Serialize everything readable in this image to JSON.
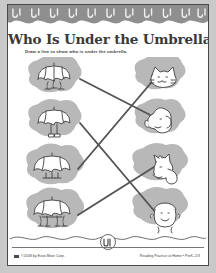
{
  "page": {
    "title": "Who Is Under the Umbrella?",
    "instruction": "Draw a line to show who is under the umbrella.",
    "background_color": "#ffffff",
    "border_color": "#4a4a4a",
    "header_band_color": "#8f8f8f",
    "blob_color": "#b4b4b4",
    "line_color": "#5a5a5a",
    "ink_color": "#3a3a3a"
  },
  "activity": {
    "type": "matching-worksheet",
    "row_count": 4,
    "left_column": [
      {
        "id": "umbrella-paws-small",
        "label": "umbrella with small paws",
        "creature": "cat"
      },
      {
        "id": "umbrella-shoes",
        "label": "umbrella with child's legs and shoes",
        "creature": "child"
      },
      {
        "id": "umbrella-paws-dog",
        "label": "umbrella with dog paws",
        "creature": "dog"
      },
      {
        "id": "umbrella-hooves",
        "label": "umbrella with four hooved legs",
        "creature": "horse"
      }
    ],
    "right_column": [
      {
        "id": "cat-head",
        "label": "cat head"
      },
      {
        "id": "dog-head",
        "label": "dog head"
      },
      {
        "id": "horse-head",
        "label": "horse head"
      },
      {
        "id": "child-head",
        "label": "child face"
      }
    ],
    "connections": [
      {
        "from": "umbrella-paws-small",
        "to": "dog-head"
      },
      {
        "from": "umbrella-shoes",
        "to": "child-head"
      },
      {
        "from": "umbrella-paws-dog",
        "to": "cat-head"
      },
      {
        "from": "umbrella-hooves",
        "to": "horse-head"
      }
    ]
  },
  "footer": {
    "copyright": "©2008 by Evan-Moor Corp.",
    "series": "Reading Practice at Home • PreK–2/3",
    "logo_label": "umbrella-circle-logo"
  },
  "decorations": {
    "header_motif": "umbrella-squiggle",
    "header_motif_count": 11
  }
}
